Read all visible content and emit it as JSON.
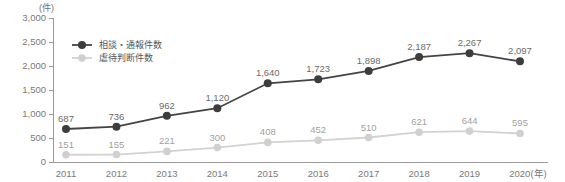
{
  "chart_data": {
    "type": "line",
    "title": "",
    "unit_label": "(件)",
    "xlabel": "(年)",
    "ylabel": "",
    "categories": [
      "2011",
      "2012",
      "2013",
      "2014",
      "2015",
      "2016",
      "2017",
      "2018",
      "2019",
      "2020"
    ],
    "ylim": [
      0,
      3000
    ],
    "yticks": [
      0,
      500,
      1000,
      1500,
      2000,
      2500,
      3000
    ],
    "ytick_labels": [
      "0",
      "500",
      "1,000",
      "1,500",
      "2,000",
      "2,500",
      "3,000"
    ],
    "grid": false,
    "legend_position": "top-left-inside",
    "series": [
      {
        "name": "相談・通報件数",
        "color": "#3d3d3d",
        "values": [
          687,
          736,
          962,
          1120,
          1640,
          1723,
          1898,
          2187,
          2267,
          2097
        ],
        "data_labels": [
          "687",
          "736",
          "962",
          "1,120",
          "1,640",
          "1,723",
          "1,898",
          "2,187",
          "2,267",
          "2,097"
        ]
      },
      {
        "name": "虐待判断件数",
        "color": "#d0d0d0",
        "values": [
          151,
          155,
          221,
          300,
          408,
          452,
          510,
          621,
          644,
          595
        ],
        "data_labels": [
          "151",
          "155",
          "221",
          "300",
          "408",
          "452",
          "510",
          "621",
          "644",
          "595"
        ]
      }
    ]
  }
}
